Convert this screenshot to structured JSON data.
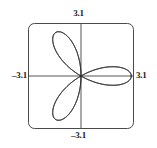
{
  "figure": {
    "kind": "graphing-calculator-viewing-window",
    "frame": {
      "shape": "rounded-rectangle",
      "stroke_color": "#4a4a4a",
      "corner_radius": 6
    },
    "axes": {
      "stroke_color": "#55555a",
      "x_axis_visible": true,
      "y_axis_visible": true
    },
    "curve": {
      "stroke_color": "#2b2b2b",
      "name": "six-petal-rose",
      "petal_count": 6
    },
    "labels": {
      "top": "3.1",
      "bottom": "–3.1",
      "left": "–3.1",
      "right": "3.1"
    }
  },
  "chart_data": {
    "type": "line",
    "title": "",
    "xlabel": "",
    "ylabel": "",
    "xlim": [
      -3.1,
      3.1
    ],
    "ylim": [
      -3.1,
      3.1
    ],
    "grid": false,
    "legend": null,
    "tick_labels": {
      "xmin": "–3.1",
      "xmax": "3.1",
      "ymin": "–3.1",
      "ymax": "3.1"
    },
    "polar": {
      "equation": "r = 3 cos(3θ)",
      "petal_count": 6,
      "petal_max_radius": 3.0,
      "petal_tip_angles_deg": [
        0,
        60,
        120,
        180,
        240,
        300
      ],
      "theta_range_deg": [
        0,
        360
      ]
    },
    "series": [
      {
        "name": "r = 3 cos(3θ)",
        "petal_tips": [
          {
            "angle_deg": 0,
            "x": 3.0,
            "y": 0.0
          },
          {
            "angle_deg": 60,
            "x": 1.5,
            "y": 2.6
          },
          {
            "angle_deg": 120,
            "x": -1.5,
            "y": 2.6
          },
          {
            "angle_deg": 180,
            "x": -3.0,
            "y": 0.0
          },
          {
            "angle_deg": 240,
            "x": -1.5,
            "y": -2.6
          },
          {
            "angle_deg": 300,
            "x": 1.5,
            "y": -2.6
          }
        ]
      }
    ]
  }
}
